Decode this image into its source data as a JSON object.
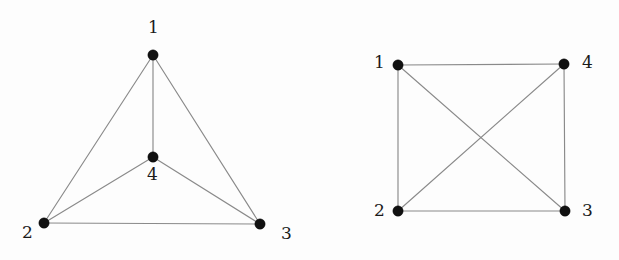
{
  "figure": {
    "background_color": "#fdfdfd",
    "edge_color": "#8a8a8a",
    "vertex_color": "#111111",
    "label_color": "#1a1a1a",
    "vertex_radius": 5.2,
    "edge_width": 1.15,
    "width": 619,
    "height": 260
  },
  "graphs": [
    {
      "id": "left-graph",
      "name": "planar-embedding-k4",
      "vertices": [
        {
          "id": "v1",
          "label": "1",
          "x": 153,
          "y": 55,
          "label_x": 148,
          "label_y": 19
        },
        {
          "id": "v2",
          "label": "2",
          "x": 44,
          "y": 223,
          "label_x": 22,
          "label_y": 224
        },
        {
          "id": "v3",
          "label": "3",
          "x": 260,
          "y": 224,
          "label_x": 281,
          "label_y": 225
        },
        {
          "id": "v4",
          "label": "4",
          "x": 153,
          "y": 157,
          "label_x": 147,
          "label_y": 166
        }
      ],
      "edges": [
        {
          "id": "e1-2",
          "from": "v1",
          "to": "v2"
        },
        {
          "id": "e1-3",
          "from": "v1",
          "to": "v3"
        },
        {
          "id": "e1-4",
          "from": "v1",
          "to": "v4"
        },
        {
          "id": "e2-3",
          "from": "v2",
          "to": "v3"
        },
        {
          "id": "e2-4",
          "from": "v2",
          "to": "v4"
        },
        {
          "id": "e3-4",
          "from": "v3",
          "to": "v4"
        }
      ]
    },
    {
      "id": "right-graph",
      "name": "square-embedding-k4",
      "vertices": [
        {
          "id": "v1",
          "label": "1",
          "x": 398,
          "y": 65,
          "label_x": 374,
          "label_y": 54
        },
        {
          "id": "v2",
          "label": "2",
          "x": 398,
          "y": 211,
          "label_x": 374,
          "label_y": 202
        },
        {
          "id": "v3",
          "label": "3",
          "x": 565,
          "y": 211,
          "label_x": 582,
          "label_y": 202
        },
        {
          "id": "v4",
          "label": "4",
          "x": 564,
          "y": 64,
          "label_x": 582,
          "label_y": 54
        }
      ],
      "edges": [
        {
          "id": "e1-4",
          "from": "v1",
          "to": "v4"
        },
        {
          "id": "e1-2",
          "from": "v1",
          "to": "v2"
        },
        {
          "id": "e1-3",
          "from": "v1",
          "to": "v3"
        },
        {
          "id": "e2-4",
          "from": "v2",
          "to": "v4"
        },
        {
          "id": "e2-3",
          "from": "v2",
          "to": "v3"
        },
        {
          "id": "e4-3",
          "from": "v4",
          "to": "v3"
        }
      ]
    }
  ]
}
